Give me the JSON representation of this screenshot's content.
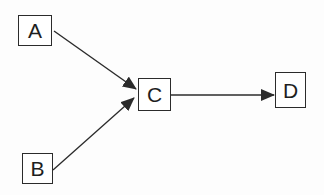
{
  "diagram": {
    "type": "directed-graph",
    "nodes": [
      {
        "id": "A",
        "label": "A"
      },
      {
        "id": "B",
        "label": "B"
      },
      {
        "id": "C",
        "label": "C"
      },
      {
        "id": "D",
        "label": "D"
      }
    ],
    "edges": [
      {
        "from": "A",
        "to": "C"
      },
      {
        "from": "B",
        "to": "C"
      },
      {
        "from": "C",
        "to": "D"
      }
    ],
    "colors": {
      "stroke": "#2b2b2b",
      "text": "#1e1e1e",
      "background": "#fdfdfd"
    }
  }
}
